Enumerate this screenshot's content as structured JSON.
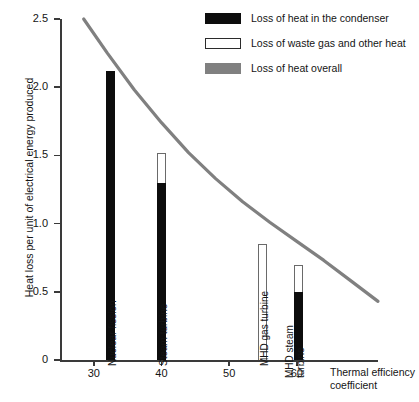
{
  "chart_data": {
    "type": "bar",
    "title": "",
    "xlabel": "Thermal efficiency coefficient",
    "ylabel": "Heat loss per unit of electrical energy produced",
    "xlim": [
      25,
      72
    ],
    "ylim": [
      0,
      2.5
    ],
    "xticks": [
      30,
      40,
      50,
      60
    ],
    "xtick_labels": [
      "30",
      "40",
      "50",
      "60"
    ],
    "yticks": [
      0,
      0.5,
      1.0,
      1.5,
      2.0,
      2.5
    ],
    "ytick_labels": [
      "0",
      "0.5",
      "1.0",
      "1.5",
      "2.0",
      "2.5"
    ],
    "grid": false,
    "legend_position": "top-right",
    "legend": [
      {
        "key": "condenser",
        "label": "Loss of heat in the condenser",
        "color": "#0d0d0d",
        "style": "filled"
      },
      {
        "key": "waste",
        "label": "Loss of waste gas and other heat",
        "color": "#ffffff",
        "style": "outlined"
      },
      {
        "key": "overall",
        "label": "Loss of heat overall",
        "color": "#808080",
        "style": "filled"
      }
    ],
    "series": [
      {
        "name": "Loss of heat in the condenser",
        "values": [
          2.12,
          1.3,
          0.0,
          0.5
        ]
      },
      {
        "name": "Loss of waste gas and other heat",
        "values": [
          0.0,
          0.22,
          0.85,
          0.2
        ]
      }
    ],
    "bars": [
      {
        "label": "Nuclear fission",
        "x": 32.5,
        "condenser": 2.12,
        "waste": 0.0,
        "total": 2.12,
        "label_lines": [
          "Nuclear fission"
        ]
      },
      {
        "label": "Steam turbine",
        "x": 40.0,
        "condenser": 1.3,
        "waste": 0.22,
        "total": 1.52,
        "label_lines": [
          "Steam turbine"
        ]
      },
      {
        "label": "MHD gas turbine",
        "x": 55.0,
        "condenser": 0.0,
        "waste": 0.85,
        "total": 0.85,
        "label_lines": [
          "MHD gas turbine"
        ]
      },
      {
        "label": "MHD steam turbine",
        "x": 60.2,
        "condenser": 0.5,
        "waste": 0.2,
        "total": 0.7,
        "label_lines": [
          "MHD steam",
          "turbine"
        ]
      }
    ],
    "curve": {
      "name": "Loss of heat overall",
      "color": "#808080",
      "x": [
        28.5,
        32,
        36,
        40,
        44,
        48,
        52,
        56,
        60,
        64,
        68,
        72
      ],
      "y": [
        2.5,
        2.25,
        1.98,
        1.74,
        1.52,
        1.33,
        1.16,
        1.01,
        0.87,
        0.73,
        0.58,
        0.43
      ]
    },
    "colors": {
      "condenser": "#0d0d0d",
      "waste": "#ffffff",
      "waste_outline": "#6a6a6a",
      "overall": "#808080",
      "axis": "#3a3a3a",
      "text": "#141414",
      "background": "#ffffff"
    }
  }
}
